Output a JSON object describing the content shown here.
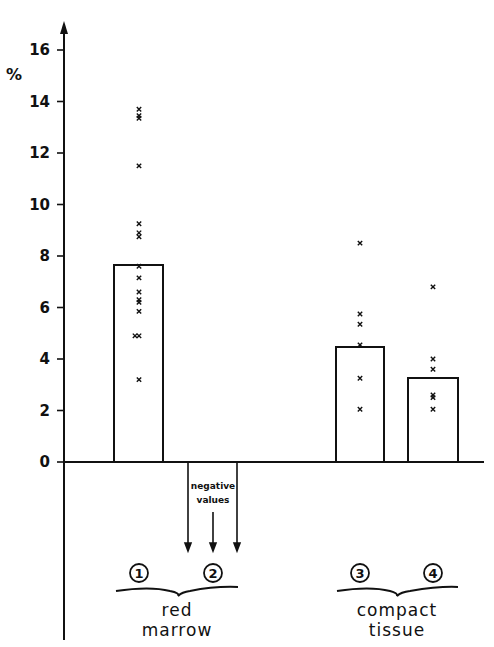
{
  "chart_data": {
    "type": "bar",
    "title": "",
    "xlabel": "",
    "ylabel": "%",
    "ylim": [
      0,
      16
    ],
    "yticks": [
      0,
      2,
      4,
      6,
      8,
      10,
      12,
      14,
      16
    ],
    "grid": false,
    "categories": [
      "1",
      "2",
      "3",
      "4"
    ],
    "values": [
      7.65,
      null,
      4.47,
      3.26
    ],
    "bars": [
      {
        "id": "1",
        "group": "red marrow",
        "mean": 7.65,
        "points": [
          13.7,
          13.45,
          13.35,
          11.5,
          9.25,
          8.9,
          8.75,
          7.6,
          7.15,
          6.6,
          6.3,
          6.2,
          5.85,
          4.9,
          4.9,
          3.2
        ]
      },
      {
        "id": "2",
        "group": "red marrow",
        "mean": null,
        "note": "negative values",
        "points": []
      },
      {
        "id": "3",
        "group": "compact tissue",
        "mean": 4.47,
        "points": [
          8.5,
          5.75,
          5.35,
          4.55,
          3.25,
          2.05
        ]
      },
      {
        "id": "4",
        "group": "compact tissue",
        "mean": 3.26,
        "points": [
          6.8,
          4.0,
          3.6,
          2.6,
          2.5,
          2.05
        ]
      }
    ],
    "groups": [
      {
        "label_line1": "red",
        "label_line2": "marrow",
        "members": [
          "1",
          "2"
        ]
      },
      {
        "label_line1": "compact",
        "label_line2": "tissue",
        "members": [
          "3",
          "4"
        ]
      }
    ],
    "annotations": [
      {
        "text_line1": "negative",
        "text_line2": "values",
        "target": "2"
      }
    ]
  },
  "axis": {
    "unit": "%",
    "ticks": [
      "0",
      "2",
      "4",
      "6",
      "8",
      "10",
      "12",
      "14",
      "16"
    ]
  },
  "labels": {
    "circle_1": "1",
    "circle_2": "2",
    "circle_3": "3",
    "circle_4": "4",
    "neg_line1": "negative",
    "neg_line2": "values",
    "group1_line1": "red",
    "group1_line2": "marrow",
    "group2_line1": "compact",
    "group2_line2": "tissue"
  }
}
